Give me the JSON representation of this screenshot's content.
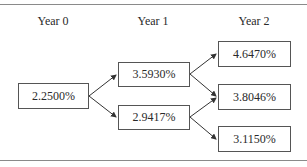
{
  "diagram": {
    "columns": [
      {
        "label": "Year 0"
      },
      {
        "label": "Year 1"
      },
      {
        "label": "Year 2"
      }
    ],
    "nodes": {
      "y0": {
        "value": "2.2500%"
      },
      "y1_up": {
        "value": "3.5930%"
      },
      "y1_down": {
        "value": "2.9417%"
      },
      "y2_upup": {
        "value": "4.6470%"
      },
      "y2_mid": {
        "value": "3.8046%"
      },
      "y2_downdown": {
        "value": "3.1150%"
      }
    },
    "edges": [
      {
        "from": "2.2500%",
        "to": "3.5930%"
      },
      {
        "from": "2.2500%",
        "to": "2.9417%"
      },
      {
        "from": "3.5930%",
        "to": "4.6470%"
      },
      {
        "from": "3.5930%",
        "to": "3.8046%"
      },
      {
        "from": "2.9417%",
        "to": "3.8046%"
      },
      {
        "from": "2.9417%",
        "to": "3.1150%"
      }
    ],
    "colors": {
      "box_border": "#555555",
      "arrow": "#333333",
      "rule": "#8a8a8a"
    }
  }
}
